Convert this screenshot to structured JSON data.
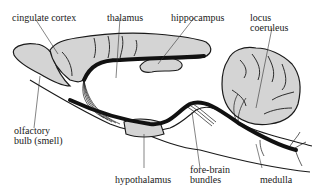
{
  "diagram": {
    "type": "anatomical sagittal brain section",
    "colors": {
      "tissue_fill": "#d4d4d4",
      "outline": "#1a1a1a",
      "fiber_bundle": "#111111",
      "background": "#ffffff"
    },
    "labels": {
      "cingulate_cortex": "cingulate cortex",
      "thalamus": "thalamus",
      "hippocampus": "hippocampus",
      "locus_coeruleus_line1": "locus",
      "locus_coeruleus_line2": "coeruleus",
      "olfactory_bulb_line1": "olfactory",
      "olfactory_bulb_line2": "bulb (smell)",
      "hypothalamus": "hypothalamus",
      "fore_brain_bundles_line1": "fore-brain",
      "fore_brain_bundles_line2": "bundles",
      "medulla": "medulla"
    }
  }
}
